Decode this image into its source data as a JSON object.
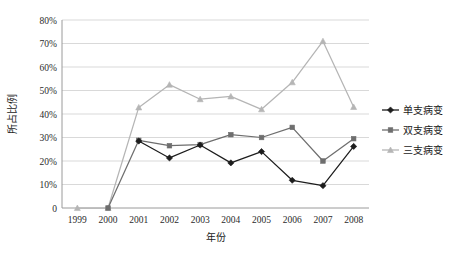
{
  "chart_data": {
    "type": "line",
    "title": "",
    "xlabel": "年份",
    "ylabel": "所占比例",
    "categories": [
      "1999",
      "2000",
      "2001",
      "2002",
      "2003",
      "2004",
      "2005",
      "2006",
      "2007",
      "2008"
    ],
    "ylim": [
      0,
      80
    ],
    "ytick_labels": [
      "0",
      "10%",
      "20%",
      "30%",
      "40%",
      "50%",
      "60%",
      "70%",
      "80%"
    ],
    "ytick_values": [
      0,
      10,
      20,
      30,
      40,
      50,
      60,
      70,
      80
    ],
    "grid": true,
    "legend_position": "right",
    "series": [
      {
        "name": "单支病变",
        "color": "#1d1d1d",
        "marker": "diamond",
        "values": [
          null,
          null,
          28.5,
          21.3,
          26.8,
          19.2,
          24.0,
          11.8,
          9.5,
          26.2
        ]
      },
      {
        "name": "双支病变",
        "color": "#6e6e6e",
        "marker": "square",
        "values": [
          null,
          0,
          28.8,
          26.5,
          27.0,
          31.2,
          30.0,
          34.3,
          20.0,
          29.5
        ]
      },
      {
        "name": "三支病变",
        "color": "#b5b5b5",
        "marker": "triangle",
        "values": [
          0,
          0,
          42.8,
          52.5,
          46.3,
          47.5,
          42.0,
          53.5,
          71.0,
          43.0
        ]
      }
    ]
  },
  "colors": {
    "single_vessel": "#1d1d1d",
    "double_vessel": "#6e6e6e",
    "triple_vessel": "#b5b5b5",
    "gridline": "#d9d9d9",
    "axis": "#9a9a9a",
    "background": "#ffffff"
  }
}
